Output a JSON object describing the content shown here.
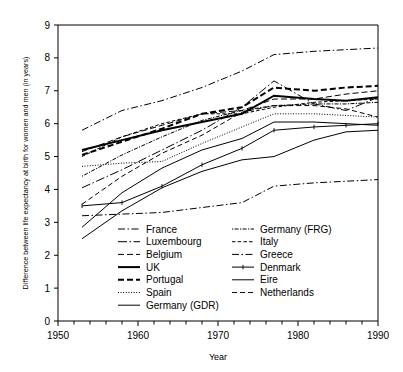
{
  "chart_data": {
    "type": "line",
    "title": "",
    "xlabel": "Year",
    "ylabel": "Difference between life expectancy at birth for women and men (in years)",
    "xlim": [
      1950,
      1990
    ],
    "ylim": [
      0,
      9
    ],
    "x_ticks_major": [
      1950,
      1960,
      1970,
      1980,
      1990
    ],
    "x_ticks_minor_step": 2,
    "y_ticks": [
      0,
      1,
      2,
      3,
      4,
      5,
      6,
      7,
      8,
      9
    ],
    "grid": false,
    "legend_position": "inside-bottom-center",
    "legend_columns": 2,
    "series": [
      {
        "name": "France",
        "style": "dashdot",
        "width": 1.0,
        "x": [
          1953,
          1958,
          1963,
          1968,
          1973,
          1977,
          1982,
          1986,
          1990
        ],
        "values": [
          5.8,
          6.4,
          6.7,
          7.1,
          7.6,
          8.1,
          8.2,
          8.25,
          8.3
        ]
      },
      {
        "name": "Luxembourg",
        "style": "longdashdot",
        "width": 1.0,
        "x": [
          1953,
          1958,
          1963,
          1968,
          1973,
          1977,
          1982,
          1986,
          1990
        ],
        "values": [
          4.05,
          4.6,
          5.2,
          5.8,
          6.5,
          7.3,
          6.6,
          6.4,
          6.8
        ]
      },
      {
        "name": "Belgium",
        "style": "dashed",
        "width": 1.0,
        "x": [
          1953,
          1958,
          1963,
          1968,
          1973,
          1977,
          1982,
          1986,
          1990
        ],
        "values": [
          5.15,
          5.6,
          5.95,
          6.3,
          6.4,
          6.75,
          6.75,
          6.9,
          7.0
        ]
      },
      {
        "name": "UK",
        "style": "solid",
        "width": 2.0,
        "x": [
          1953,
          1958,
          1963,
          1968,
          1973,
          1977,
          1982,
          1986,
          1990
        ],
        "values": [
          5.2,
          5.5,
          5.8,
          6.05,
          6.3,
          6.85,
          6.75,
          6.7,
          6.8
        ]
      },
      {
        "name": "Portugal",
        "style": "dashed",
        "width": 2.0,
        "x": [
          1953,
          1958,
          1963,
          1968,
          1973,
          1977,
          1982,
          1986,
          1990
        ],
        "values": [
          5.05,
          5.45,
          5.85,
          6.3,
          6.5,
          7.1,
          7.0,
          7.1,
          7.15
        ]
      },
      {
        "name": "Spain",
        "style": "dotted",
        "width": 1.0,
        "x": [
          1953,
          1958,
          1963,
          1968,
          1973,
          1977,
          1982,
          1986,
          1990
        ],
        "values": [
          4.7,
          4.8,
          4.85,
          5.4,
          5.9,
          6.3,
          6.3,
          6.25,
          6.2
        ]
      },
      {
        "name": "Germany (GDR)",
        "style": "solid",
        "width": 1.0,
        "x": [
          1953,
          1958,
          1963,
          1968,
          1973,
          1977,
          1982,
          1986,
          1990
        ],
        "values": [
          2.85,
          3.9,
          4.65,
          5.2,
          5.55,
          6.05,
          6.05,
          6.0,
          5.95
        ]
      },
      {
        "name": "Germany (FRG)",
        "style": "finedashdot",
        "width": 1.0,
        "x": [
          1953,
          1958,
          1963,
          1968,
          1973,
          1977,
          1982,
          1986,
          1990
        ],
        "values": [
          4.4,
          5.05,
          5.6,
          6.1,
          6.4,
          6.55,
          6.6,
          6.6,
          6.65
        ]
      },
      {
        "name": "Italy",
        "style": "shortdash",
        "width": 1.0,
        "x": [
          1953,
          1958,
          1963,
          1968,
          1973,
          1977,
          1982,
          1986,
          1990
        ],
        "values": [
          5.0,
          5.6,
          6.0,
          6.3,
          6.3,
          6.5,
          6.65,
          6.7,
          6.75
        ]
      },
      {
        "name": "Greece",
        "style": "dashdot",
        "width": 1.0,
        "x": [
          1953,
          1958,
          1963,
          1968,
          1973,
          1977,
          1982,
          1986,
          1990
        ],
        "values": [
          3.2,
          3.25,
          3.3,
          3.45,
          3.6,
          4.1,
          4.2,
          4.25,
          4.3
        ]
      },
      {
        "name": "Denmark",
        "style": "solid-marker",
        "width": 1.0,
        "x": [
          1953,
          1958,
          1963,
          1968,
          1973,
          1977,
          1982,
          1986,
          1990
        ],
        "values": [
          3.5,
          3.6,
          4.1,
          4.75,
          5.25,
          5.8,
          5.9,
          5.95,
          6.0
        ]
      },
      {
        "name": "Eire",
        "style": "solid",
        "width": 1.0,
        "x": [
          1953,
          1958,
          1963,
          1968,
          1973,
          1977,
          1982,
          1986,
          1990
        ],
        "values": [
          2.5,
          3.35,
          4.05,
          4.55,
          4.9,
          5.0,
          5.5,
          5.75,
          5.8
        ]
      },
      {
        "name": "Netherlands",
        "style": "mediumdash",
        "width": 1.0,
        "x": [
          1953,
          1958,
          1963,
          1968,
          1973,
          1977,
          1982,
          1986,
          1990
        ],
        "values": [
          3.55,
          4.4,
          5.1,
          5.65,
          6.35,
          6.55,
          6.55,
          6.45,
          6.2
        ]
      }
    ]
  },
  "axes": {
    "x_tick_labels": [
      "1950",
      "1960",
      "1970",
      "1980",
      "1990"
    ],
    "y_tick_labels": [
      "0",
      "1",
      "2",
      "3",
      "4",
      "5",
      "6",
      "7",
      "8",
      "9"
    ],
    "x_axis_title": "Year",
    "y_axis_title": "Difference between life expectancy at birth for women and men (in years)"
  },
  "legend": {
    "column_left": [
      "France",
      "Luxembourg",
      "Belgium",
      "UK",
      "Portugal",
      "Spain",
      "Germany (GDR)"
    ],
    "column_right": [
      "Germany (FRG)",
      "Italy",
      "Greece",
      "Denmark",
      "Eire",
      "Netherlands"
    ]
  },
  "colors": {
    "line": "#000000",
    "axis": "#000000",
    "background": "#ffffff"
  }
}
